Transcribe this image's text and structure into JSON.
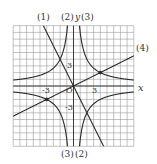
{
  "figure": {
    "type": "coordinate-graph",
    "axes": {
      "x_label": "x",
      "y_label": "y",
      "origin_label": "O"
    },
    "ticks": {
      "x": [
        "-3",
        "3"
      ],
      "y": [
        "3",
        "-3"
      ]
    },
    "grid": {
      "xmin": -9,
      "xmax": 9,
      "ymin": -9,
      "ymax": 9,
      "step": 1
    },
    "curve_labels": {
      "top": [
        "(1)",
        "(2)",
        "(3)"
      ],
      "right": "(4)",
      "bottom": [
        "(3)",
        "(2)"
      ]
    },
    "curves": [
      {
        "id": "1",
        "kind": "line",
        "equation": "y = -2x"
      },
      {
        "id": "2",
        "kind": "hyperbola",
        "equation": "y = -8/x"
      },
      {
        "id": "3",
        "kind": "hyperbola",
        "equation": "y = 8/x"
      },
      {
        "id": "4",
        "kind": "line",
        "equation": "y = x/2"
      }
    ],
    "points": [
      {
        "x": 4,
        "y": 2
      },
      {
        "x": -4,
        "y": -2
      }
    ],
    "colors": {
      "grid": "#9a9a9a",
      "curve": "#2a2a2a",
      "axis": "#2a2a2a"
    }
  }
}
